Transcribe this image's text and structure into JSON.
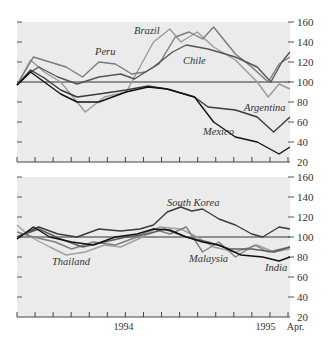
{
  "chart_data": [
    {
      "type": "line",
      "title": "",
      "xlabel": "",
      "ylabel": "",
      "ylim": [
        20,
        160
      ],
      "yticks": [
        20,
        40,
        60,
        80,
        100,
        120,
        140,
        160
      ],
      "reference_line": 100,
      "x_domain": [
        0,
        100
      ],
      "x_tick_count": 16,
      "series": [
        {
          "name": "Brazil",
          "label": "Brazil",
          "color": "#9a9a9a",
          "x": [
            0,
            5,
            10,
            16,
            22,
            25,
            32,
            40,
            45,
            50,
            56,
            60,
            66,
            72,
            80,
            88,
            92,
            96,
            100
          ],
          "values": [
            97,
            122,
            110,
            100,
            80,
            70,
            85,
            90,
            115,
            140,
            153,
            140,
            150,
            135,
            122,
            100,
            85,
            98,
            93
          ]
        },
        {
          "name": "Peru",
          "label": "Peru",
          "color": "#7a7a7a",
          "x": [
            0,
            6,
            12,
            18,
            24,
            30,
            36,
            42,
            47,
            52,
            58,
            63,
            68,
            72,
            80,
            86,
            92,
            96,
            100
          ],
          "values": [
            97,
            125,
            120,
            115,
            105,
            120,
            118,
            108,
            110,
            118,
            145,
            150,
            143,
            155,
            128,
            115,
            100,
            118,
            125
          ]
        },
        {
          "name": "Chile",
          "label": "Chile",
          "color": "#555555",
          "x": [
            0,
            5,
            8,
            15,
            22,
            30,
            38,
            43,
            50,
            57,
            62,
            70,
            80,
            88,
            93,
            97,
            100
          ],
          "values": [
            97,
            110,
            115,
            105,
            98,
            105,
            108,
            103,
            115,
            130,
            137,
            133,
            125,
            115,
            100,
            120,
            130
          ]
        },
        {
          "name": "Argentina",
          "label": "Argentina",
          "color": "#3a3a3a",
          "x": [
            0,
            5,
            10,
            16,
            22,
            30,
            40,
            48,
            55,
            65,
            70,
            80,
            88,
            94,
            100
          ],
          "values": [
            97,
            112,
            104,
            92,
            85,
            88,
            92,
            96,
            93,
            85,
            75,
            72,
            65,
            50,
            65
          ]
        },
        {
          "name": "Mexico",
          "label": "Mexico",
          "color": "#111111",
          "x": [
            0,
            5,
            10,
            16,
            22,
            30,
            40,
            48,
            55,
            65,
            72,
            80,
            88,
            96,
            100
          ],
          "values": [
            97,
            110,
            100,
            88,
            80,
            80,
            90,
            95,
            93,
            85,
            60,
            45,
            40,
            28,
            35
          ]
        }
      ]
    },
    {
      "type": "line",
      "title": "",
      "xlabel": "",
      "ylabel": "",
      "ylim": [
        20,
        160
      ],
      "yticks": [
        20,
        40,
        60,
        80,
        100,
        120,
        140,
        160
      ],
      "reference_line": 100,
      "x_domain": [
        0,
        100
      ],
      "x_tick_count": 16,
      "x_labels": [
        {
          "text": "1994",
          "x": 39
        },
        {
          "text": "1995",
          "x": 91
        },
        {
          "text": "Apr.",
          "x": 102
        }
      ],
      "series": [
        {
          "name": "South Korea",
          "label": "South Korea",
          "color": "#3a3a3a",
          "x": [
            0,
            8,
            15,
            22,
            30,
            38,
            45,
            50,
            55,
            60,
            64,
            68,
            74,
            80,
            86,
            90,
            96,
            100
          ],
          "values": [
            100,
            110,
            103,
            100,
            108,
            106,
            108,
            112,
            125,
            130,
            126,
            128,
            118,
            112,
            103,
            100,
            110,
            108
          ]
        },
        {
          "name": "Thailand",
          "label": "Thailand",
          "color": "#a0a0a0",
          "x": [
            0,
            5,
            12,
            18,
            25,
            32,
            38,
            46,
            52,
            60,
            66,
            72,
            80,
            88,
            94,
            100
          ],
          "values": [
            112,
            100,
            90,
            82,
            85,
            92,
            90,
            100,
            110,
            108,
            100,
            90,
            85,
            92,
            85,
            88
          ]
        },
        {
          "name": "Malaysia",
          "label": "Malaysia",
          "color": "#808080",
          "x": [
            0,
            6,
            14,
            20,
            28,
            36,
            44,
            50,
            56,
            62,
            68,
            74,
            80,
            87,
            92,
            100
          ],
          "values": [
            105,
            100,
            95,
            88,
            95,
            92,
            100,
            108,
            103,
            110,
            85,
            95,
            80,
            92,
            85,
            90
          ]
        },
        {
          "name": "Other",
          "label": "",
          "color": "#5c5c5c",
          "x": [
            0,
            8,
            16,
            24,
            32,
            40,
            48,
            54,
            62,
            70,
            78,
            86,
            94,
            100
          ],
          "values": [
            100,
            108,
            98,
            90,
            95,
            100,
            103,
            108,
            100,
            95,
            88,
            88,
            85,
            90
          ]
        },
        {
          "name": "India",
          "label": "India",
          "color": "#111111",
          "x": [
            0,
            6,
            12,
            20,
            28,
            36,
            44,
            50,
            56,
            62,
            68,
            74,
            82,
            90,
            96,
            100
          ],
          "values": [
            98,
            110,
            100,
            95,
            92,
            100,
            103,
            108,
            107,
            100,
            95,
            92,
            82,
            80,
            76,
            80
          ]
        }
      ]
    }
  ]
}
